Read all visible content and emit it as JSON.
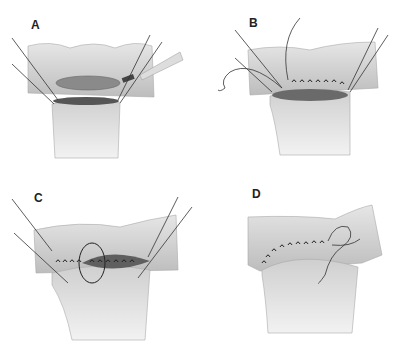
{
  "figure": {
    "panels": [
      {
        "id": "A",
        "label": "A",
        "description": "Open bowel and end of tube aligned with corner stay sutures; instrument at right"
      },
      {
        "id": "B",
        "label": "B",
        "description": "Posterior row of running sutures placed"
      },
      {
        "id": "C",
        "label": "C",
        "description": "Suture continued around to anterior row with loop"
      },
      {
        "id": "D",
        "label": "D",
        "description": "Completed anastomosis with suture tail"
      }
    ],
    "colors": {
      "tissue": "#d9d9d9",
      "tissue_dark": "#b5b5b5",
      "lumen": "#6e6e6e",
      "suture": "#222222",
      "background": "#ffffff"
    }
  }
}
